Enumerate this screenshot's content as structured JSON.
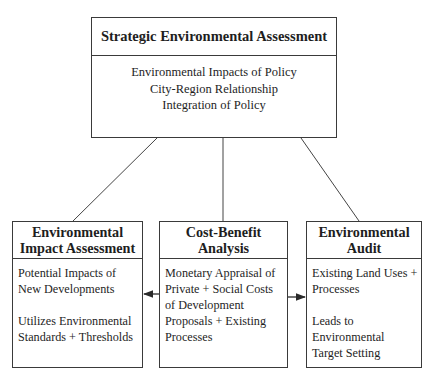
{
  "top_box": {
    "title": "Strategic Environmental Assessment",
    "items": [
      "Environmental Impacts of Policy",
      "City-Region Relationship",
      "Integration of Policy"
    ]
  },
  "boxes": [
    {
      "title_line1": "Environmental",
      "title_line2": "Impact Assessment",
      "para1": [
        "Potential Impacts of",
        "New Developments"
      ],
      "para2": [
        "Utilizes Environmental",
        "Standards + Thresholds"
      ]
    },
    {
      "title_line1": "Cost-Benefit",
      "title_line2": "Analysis",
      "para1": [
        "Monetary Appraisal of",
        "Private + Social Costs",
        "of Development",
        "Proposals + Existing",
        "Processes"
      ]
    },
    {
      "title_line1": "Environmental",
      "title_line2": "Audit",
      "para1": [
        "Existing Land Uses +",
        "Processes"
      ],
      "para2": [
        "Leads to",
        "Environmental",
        "Target Setting"
      ]
    }
  ],
  "connections": [
    {
      "from": "Strategic Environmental Assessment",
      "to": "Environmental Impact Assessment",
      "type": "line"
    },
    {
      "from": "Strategic Environmental Assessment",
      "to": "Cost-Benefit Analysis",
      "type": "line"
    },
    {
      "from": "Strategic Environmental Assessment",
      "to": "Environmental Audit",
      "type": "line"
    },
    {
      "from": "Cost-Benefit Analysis",
      "to": "Environmental Impact Assessment",
      "type": "arrow"
    },
    {
      "from": "Cost-Benefit Analysis",
      "to": "Environmental Audit",
      "type": "arrow"
    }
  ],
  "colors": {
    "line": "#3a3a3a",
    "text": "#1e1e1e",
    "background": "#ffffff"
  }
}
